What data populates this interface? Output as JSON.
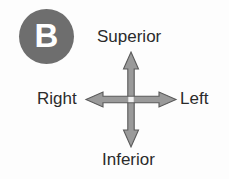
{
  "figure": {
    "panel_badge": {
      "letter": "B",
      "shape": "circle",
      "fill_color": "#6e6e6e",
      "text_color": "#ffffff"
    },
    "background_color": "#fdfdfd",
    "label_color": "#2b2b2b"
  },
  "orientation_diagram": {
    "type": "anatomical-orientation-cross",
    "arrow_fill_color": "#9a9a9a",
    "arrow_outline_color": "#5a5a5a",
    "labels": {
      "superior": "Superior",
      "inferior": "Inferior",
      "right": "Right",
      "left": "Left"
    },
    "axes": [
      {
        "name": "vertical-axis",
        "positive_label": "Superior",
        "negative_label": "Inferior",
        "double_headed": true
      },
      {
        "name": "horizontal-axis",
        "positive_label": "Left",
        "negative_label": "Right",
        "double_headed": true
      }
    ]
  }
}
